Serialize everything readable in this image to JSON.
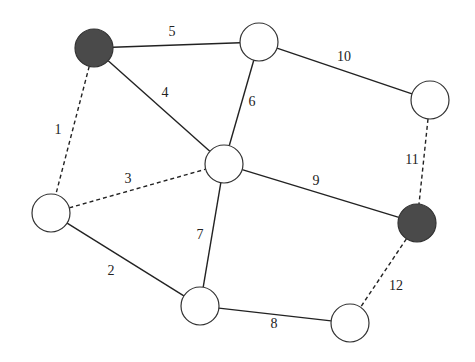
{
  "diagram": {
    "type": "graph",
    "nodes": [
      {
        "id": "A",
        "x": 94,
        "y": 48,
        "filled": true
      },
      {
        "id": "B",
        "x": 259,
        "y": 42,
        "filled": false
      },
      {
        "id": "C",
        "x": 430,
        "y": 100,
        "filled": false
      },
      {
        "id": "D",
        "x": 224,
        "y": 164,
        "filled": false
      },
      {
        "id": "E",
        "x": 51,
        "y": 213,
        "filled": false
      },
      {
        "id": "F",
        "x": 417,
        "y": 223,
        "filled": true
      },
      {
        "id": "G",
        "x": 200,
        "y": 306,
        "filled": false
      },
      {
        "id": "H",
        "x": 350,
        "y": 323,
        "filled": false
      }
    ],
    "edges": [
      {
        "label": "1",
        "from": "A",
        "to": "E",
        "style": "dashed",
        "lx": 58,
        "ly": 131
      },
      {
        "label": "2",
        "from": "E",
        "to": "G",
        "style": "solid",
        "lx": 111,
        "ly": 272
      },
      {
        "label": "3",
        "from": "E",
        "to": "D",
        "style": "dashed",
        "lx": 128,
        "ly": 180
      },
      {
        "label": "4",
        "from": "A",
        "to": "D",
        "style": "solid",
        "lx": 165,
        "ly": 94
      },
      {
        "label": "5",
        "from": "A",
        "to": "B",
        "style": "solid",
        "lx": 172,
        "ly": 33
      },
      {
        "label": "6",
        "from": "B",
        "to": "D",
        "style": "solid",
        "lx": 252,
        "ly": 103
      },
      {
        "label": "7",
        "from": "D",
        "to": "G",
        "style": "solid",
        "lx": 200,
        "ly": 236
      },
      {
        "label": "8",
        "from": "G",
        "to": "H",
        "style": "solid",
        "lx": 274,
        "ly": 325
      },
      {
        "label": "9",
        "from": "D",
        "to": "F",
        "style": "solid",
        "lx": 316,
        "ly": 182
      },
      {
        "label": "10",
        "from": "B",
        "to": "C",
        "style": "solid",
        "lx": 344,
        "ly": 58
      },
      {
        "label": "11",
        "from": "C",
        "to": "F",
        "style": "dashed",
        "lx": 412,
        "ly": 161
      },
      {
        "label": "12",
        "from": "F",
        "to": "H",
        "style": "dashed",
        "lx": 396,
        "ly": 287
      }
    ],
    "node_radius": 19,
    "colors": {
      "filled": "#4a4a4a",
      "stroke": "#333333",
      "edge": "#222222"
    }
  }
}
